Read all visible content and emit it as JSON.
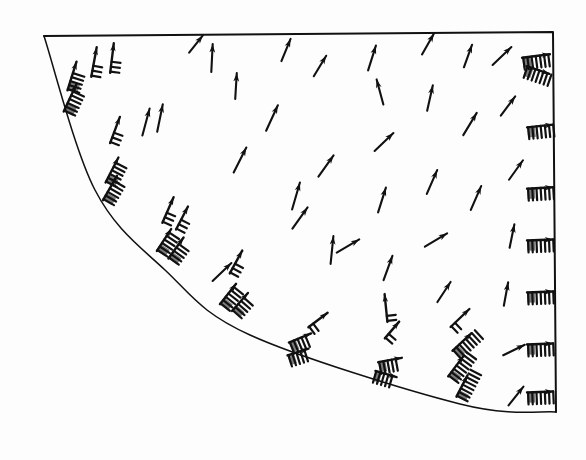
{
  "figure": {
    "title": "Velocity vector field in quarter-annulus sector domain",
    "background_color": "#fdfdfd",
    "ink_color": "#111111",
    "domain_label": "quarter-sector",
    "caption": ""
  },
  "boundary": {
    "name": "sector-outline",
    "stroke_color": "#111111",
    "stroke_width": 2.0,
    "corners": {
      "top_left": [
        44,
        36
      ],
      "top_right": [
        553,
        32
      ],
      "bottom_right": [
        556,
        412
      ]
    },
    "top_edge": {
      "from": [
        44,
        36
      ],
      "to": [
        553,
        32
      ]
    },
    "right_edge": {
      "from": [
        553,
        32
      ],
      "to": [
        556,
        412
      ]
    },
    "arc": {
      "from": [
        44,
        36
      ],
      "to": [
        556,
        412
      ],
      "via": [
        95,
        190,
        165,
        270,
        250,
        335,
        460,
        404
      ],
      "center": [
        560,
        -70
      ],
      "radius": 522,
      "sweep": "concave-toward-top-right"
    }
  },
  "chart_data": {
    "type": "quiver",
    "title": "Velocity vector field in quarter-annulus sector domain",
    "xlabel": "",
    "ylabel": "",
    "xlim": [
      0,
      586
    ],
    "ylim": [
      0,
      460
    ],
    "grid": false,
    "legend": "none",
    "axis_ticks": "none",
    "glyph_types": [
      "plain-arrow",
      "barbed-arrow",
      "multi-barb-cluster"
    ],
    "notes": "Scanned monochrome figure. Arrows are velocity vectors; clustered hatched glyphs along the curved inner boundary and the right-hand straight boundary are high-magnitude multi-barb vectors (wind-barb style). Flow generally sweeps from lower-left up and to the right, rotating counter-clockwise near the mid-field and converging on the right edge.",
    "vectors": [
      {
        "x": 72,
        "y": 76,
        "dx": 0.3,
        "dy": -0.95,
        "len": 30,
        "style": "multi-barb-cluster",
        "barbs": 5
      },
      {
        "x": 70,
        "y": 98,
        "dx": 0.42,
        "dy": -0.91,
        "len": 30,
        "style": "multi-barb-cluster",
        "barbs": 6
      },
      {
        "x": 94,
        "y": 62,
        "dx": 0.18,
        "dy": -0.98,
        "len": 30,
        "style": "barbed-arrow",
        "barbs": 3
      },
      {
        "x": 112,
        "y": 58,
        "dx": 0.12,
        "dy": -0.99,
        "len": 30,
        "style": "barbed-arrow",
        "barbs": 3
      },
      {
        "x": 115,
        "y": 130,
        "dx": 0.35,
        "dy": -0.94,
        "len": 28,
        "style": "barbed-arrow",
        "barbs": 3
      },
      {
        "x": 112,
        "y": 170,
        "dx": 0.46,
        "dy": -0.89,
        "len": 28,
        "style": "multi-barb-cluster",
        "barbs": 6
      },
      {
        "x": 110,
        "y": 188,
        "dx": 0.5,
        "dy": -0.87,
        "len": 28,
        "style": "multi-barb-cluster",
        "barbs": 6
      },
      {
        "x": 146,
        "y": 122,
        "dx": 0.26,
        "dy": -0.97,
        "len": 28,
        "style": "plain-arrow",
        "barbs": 0
      },
      {
        "x": 160,
        "y": 118,
        "dx": 0.2,
        "dy": -0.98,
        "len": 28,
        "style": "plain-arrow",
        "barbs": 0
      },
      {
        "x": 168,
        "y": 210,
        "dx": 0.4,
        "dy": -0.92,
        "len": 28,
        "style": "barbed-arrow",
        "barbs": 3
      },
      {
        "x": 182,
        "y": 218,
        "dx": 0.46,
        "dy": -0.89,
        "len": 26,
        "style": "barbed-arrow",
        "barbs": 3
      },
      {
        "x": 164,
        "y": 240,
        "dx": 0.55,
        "dy": -0.84,
        "len": 26,
        "style": "multi-barb-cluster",
        "barbs": 6
      },
      {
        "x": 176,
        "y": 248,
        "dx": 0.58,
        "dy": -0.81,
        "len": 26,
        "style": "multi-barb-cluster",
        "barbs": 5
      },
      {
        "x": 212,
        "y": 58,
        "dx": 0.05,
        "dy": -1.0,
        "len": 28,
        "style": "plain-arrow",
        "barbs": 0
      },
      {
        "x": 196,
        "y": 44,
        "dx": 0.62,
        "dy": -0.78,
        "len": 22,
        "style": "plain-arrow",
        "barbs": 0
      },
      {
        "x": 236,
        "y": 86,
        "dx": 0.06,
        "dy": -1.0,
        "len": 26,
        "style": "plain-arrow",
        "barbs": 0
      },
      {
        "x": 240,
        "y": 160,
        "dx": 0.45,
        "dy": -0.89,
        "len": 28,
        "style": "plain-arrow",
        "barbs": 0
      },
      {
        "x": 236,
        "y": 262,
        "dx": 0.48,
        "dy": -0.88,
        "len": 26,
        "style": "barbed-arrow",
        "barbs": 3
      },
      {
        "x": 222,
        "y": 272,
        "dx": 0.72,
        "dy": -0.69,
        "len": 26,
        "style": "plain-arrow",
        "barbs": 0
      },
      {
        "x": 228,
        "y": 294,
        "dx": 0.62,
        "dy": -0.78,
        "len": 26,
        "style": "multi-barb-cluster",
        "barbs": 6
      },
      {
        "x": 240,
        "y": 302,
        "dx": 0.66,
        "dy": -0.75,
        "len": 24,
        "style": "multi-barb-cluster",
        "barbs": 5
      },
      {
        "x": 272,
        "y": 118,
        "dx": 0.42,
        "dy": -0.91,
        "len": 28,
        "style": "plain-arrow",
        "barbs": 0
      },
      {
        "x": 286,
        "y": 50,
        "dx": 0.38,
        "dy": -0.92,
        "len": 24,
        "style": "plain-arrow",
        "barbs": 0
      },
      {
        "x": 296,
        "y": 196,
        "dx": 0.28,
        "dy": -0.96,
        "len": 28,
        "style": "plain-arrow",
        "barbs": 0
      },
      {
        "x": 300,
        "y": 218,
        "dx": 0.58,
        "dy": -0.81,
        "len": 26,
        "style": "plain-arrow",
        "barbs": 0
      },
      {
        "x": 320,
        "y": 66,
        "dx": 0.52,
        "dy": -0.86,
        "len": 24,
        "style": "plain-arrow",
        "barbs": 0
      },
      {
        "x": 326,
        "y": 166,
        "dx": 0.58,
        "dy": -0.81,
        "len": 26,
        "style": "plain-arrow",
        "barbs": 0
      },
      {
        "x": 332,
        "y": 250,
        "dx": 0.1,
        "dy": -0.99,
        "len": 28,
        "style": "plain-arrow",
        "barbs": 0
      },
      {
        "x": 318,
        "y": 320,
        "dx": 0.8,
        "dy": -0.6,
        "len": 24,
        "style": "barbed-arrow",
        "barbs": 2
      },
      {
        "x": 300,
        "y": 338,
        "dx": 0.92,
        "dy": -0.38,
        "len": 24,
        "style": "multi-barb-cluster",
        "barbs": 5
      },
      {
        "x": 298,
        "y": 352,
        "dx": 0.95,
        "dy": -0.3,
        "len": 22,
        "style": "multi-barb-cluster",
        "barbs": 5
      },
      {
        "x": 348,
        "y": 246,
        "dx": 0.86,
        "dy": -0.5,
        "len": 26,
        "style": "plain-arrow",
        "barbs": 0
      },
      {
        "x": 372,
        "y": 58,
        "dx": 0.3,
        "dy": -0.95,
        "len": 26,
        "style": "plain-arrow",
        "barbs": 0
      },
      {
        "x": 380,
        "y": 92,
        "dx": -0.26,
        "dy": -0.97,
        "len": 26,
        "style": "plain-arrow",
        "barbs": 0
      },
      {
        "x": 384,
        "y": 142,
        "dx": 0.72,
        "dy": -0.69,
        "len": 26,
        "style": "plain-arrow",
        "barbs": 0
      },
      {
        "x": 382,
        "y": 200,
        "dx": 0.3,
        "dy": -0.95,
        "len": 26,
        "style": "plain-arrow",
        "barbs": 0
      },
      {
        "x": 388,
        "y": 268,
        "dx": 0.34,
        "dy": -0.94,
        "len": 26,
        "style": "plain-arrow",
        "barbs": 0
      },
      {
        "x": 386,
        "y": 308,
        "dx": -0.1,
        "dy": -0.99,
        "len": 28,
        "style": "barbed-arrow",
        "barbs": 2
      },
      {
        "x": 392,
        "y": 330,
        "dx": 0.65,
        "dy": -0.76,
        "len": 22,
        "style": "barbed-arrow",
        "barbs": 2
      },
      {
        "x": 390,
        "y": 360,
        "dx": 0.98,
        "dy": -0.18,
        "len": 24,
        "style": "multi-barb-cluster",
        "barbs": 5
      },
      {
        "x": 386,
        "y": 374,
        "dx": 0.96,
        "dy": 0.28,
        "len": 22,
        "style": "multi-barb-cluster",
        "barbs": 5
      },
      {
        "x": 428,
        "y": 44,
        "dx": 0.5,
        "dy": -0.87,
        "len": 24,
        "style": "plain-arrow",
        "barbs": 0
      },
      {
        "x": 430,
        "y": 98,
        "dx": 0.22,
        "dy": -0.98,
        "len": 26,
        "style": "plain-arrow",
        "barbs": 0
      },
      {
        "x": 432,
        "y": 182,
        "dx": 0.4,
        "dy": -0.92,
        "len": 26,
        "style": "plain-arrow",
        "barbs": 0
      },
      {
        "x": 436,
        "y": 240,
        "dx": 0.86,
        "dy": -0.52,
        "len": 26,
        "style": "plain-arrow",
        "barbs": 0
      },
      {
        "x": 444,
        "y": 292,
        "dx": 0.55,
        "dy": -0.84,
        "len": 24,
        "style": "plain-arrow",
        "barbs": 0
      },
      {
        "x": 460,
        "y": 318,
        "dx": 0.72,
        "dy": -0.69,
        "len": 26,
        "style": "barbed-arrow",
        "barbs": 2
      },
      {
        "x": 462,
        "y": 342,
        "dx": 0.74,
        "dy": -0.68,
        "len": 26,
        "style": "multi-barb-cluster",
        "barbs": 8
      },
      {
        "x": 456,
        "y": 366,
        "dx": 0.6,
        "dy": -0.8,
        "len": 26,
        "style": "multi-barb-cluster",
        "barbs": 8
      },
      {
        "x": 462,
        "y": 386,
        "dx": 0.46,
        "dy": -0.89,
        "len": 24,
        "style": "multi-barb-cluster",
        "barbs": 8
      },
      {
        "x": 468,
        "y": 56,
        "dx": 0.34,
        "dy": -0.94,
        "len": 24,
        "style": "plain-arrow",
        "barbs": 0
      },
      {
        "x": 470,
        "y": 124,
        "dx": 0.52,
        "dy": -0.86,
        "len": 26,
        "style": "plain-arrow",
        "barbs": 0
      },
      {
        "x": 476,
        "y": 198,
        "dx": 0.4,
        "dy": -0.92,
        "len": 26,
        "style": "plain-arrow",
        "barbs": 0
      },
      {
        "x": 502,
        "y": 56,
        "dx": 0.72,
        "dy": -0.69,
        "len": 26,
        "style": "plain-arrow",
        "barbs": 0
      },
      {
        "x": 508,
        "y": 106,
        "dx": 0.6,
        "dy": -0.8,
        "len": 24,
        "style": "plain-arrow",
        "barbs": 0
      },
      {
        "x": 516,
        "y": 170,
        "dx": 0.58,
        "dy": -0.81,
        "len": 24,
        "style": "plain-arrow",
        "barbs": 0
      },
      {
        "x": 512,
        "y": 236,
        "dx": 0.2,
        "dy": -0.98,
        "len": 24,
        "style": "plain-arrow",
        "barbs": 0
      },
      {
        "x": 506,
        "y": 294,
        "dx": 0.18,
        "dy": -0.98,
        "len": 24,
        "style": "plain-arrow",
        "barbs": 0
      },
      {
        "x": 514,
        "y": 350,
        "dx": 0.9,
        "dy": -0.44,
        "len": 24,
        "style": "plain-arrow",
        "barbs": 0
      },
      {
        "x": 516,
        "y": 396,
        "dx": 0.62,
        "dy": -0.78,
        "len": 24,
        "style": "plain-arrow",
        "barbs": 0
      },
      {
        "x": 536,
        "y": 56,
        "dx": 0.92,
        "dy": -0.12,
        "len": 28,
        "style": "multi-barb-cluster",
        "barbs": 7
      },
      {
        "x": 538,
        "y": 70,
        "dx": 0.88,
        "dy": 0.3,
        "len": 24,
        "style": "multi-barb-cluster",
        "barbs": 7
      },
      {
        "x": 540,
        "y": 126,
        "dx": 0.98,
        "dy": -0.1,
        "len": 26,
        "style": "multi-barb-cluster",
        "barbs": 7
      },
      {
        "x": 540,
        "y": 188,
        "dx": 0.99,
        "dy": -0.06,
        "len": 26,
        "style": "multi-barb-cluster",
        "barbs": 7
      },
      {
        "x": 540,
        "y": 240,
        "dx": 0.99,
        "dy": -0.04,
        "len": 26,
        "style": "multi-barb-cluster",
        "barbs": 7
      },
      {
        "x": 540,
        "y": 292,
        "dx": 0.99,
        "dy": -0.04,
        "len": 26,
        "style": "multi-barb-cluster",
        "barbs": 7
      },
      {
        "x": 540,
        "y": 344,
        "dx": 0.99,
        "dy": -0.04,
        "len": 26,
        "style": "multi-barb-cluster",
        "barbs": 7
      },
      {
        "x": 540,
        "y": 392,
        "dx": 0.99,
        "dy": -0.04,
        "len": 26,
        "style": "multi-barb-cluster",
        "barbs": 7
      }
    ]
  },
  "annotations": {
    "none": ""
  }
}
